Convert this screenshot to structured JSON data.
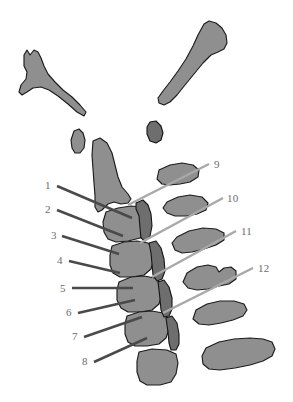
{
  "figure": {
    "type": "anatomical-illustration",
    "background_color": "#ffffff",
    "bone_fill_color": "#8f8f8f",
    "bone_fill_color_dark": "#6e6e6e",
    "bone_outline_color": "#1c1c1c",
    "label_text_color": "#6b6b6b",
    "leader_line_color_dark": "#4a4a4a",
    "leader_line_color_light": "#a8a8a8"
  },
  "labels": {
    "left": [
      {
        "id": "label-1",
        "text": "1",
        "x": 45,
        "y": 180
      },
      {
        "id": "label-2",
        "text": "2",
        "x": 45,
        "y": 204
      },
      {
        "id": "label-3",
        "text": "3",
        "x": 51,
        "y": 230
      },
      {
        "id": "label-4",
        "text": "4",
        "x": 57,
        "y": 255
      },
      {
        "id": "label-5",
        "text": "5",
        "x": 60,
        "y": 283
      },
      {
        "id": "label-6",
        "text": "6",
        "x": 66,
        "y": 307
      },
      {
        "id": "label-7",
        "text": "7",
        "x": 72,
        "y": 331
      },
      {
        "id": "label-8",
        "text": "8",
        "x": 82,
        "y": 356
      }
    ],
    "right": [
      {
        "id": "label-9",
        "text": "9",
        "x": 214,
        "y": 159
      },
      {
        "id": "label-10",
        "text": "10",
        "x": 227,
        "y": 193
      },
      {
        "id": "label-11",
        "text": "11",
        "x": 241,
        "y": 226
      },
      {
        "id": "label-12",
        "text": "12",
        "x": 258,
        "y": 263
      }
    ]
  },
  "leader_lines": {
    "left": [
      {
        "id": "leader-1",
        "x1": 57,
        "y1": 186,
        "x2": 132,
        "y2": 218,
        "tone": "dark"
      },
      {
        "id": "leader-2",
        "x1": 57,
        "y1": 210,
        "x2": 123,
        "y2": 236,
        "tone": "dark"
      },
      {
        "id": "leader-3",
        "x1": 62,
        "y1": 236,
        "x2": 119,
        "y2": 254,
        "tone": "dark"
      },
      {
        "id": "leader-4",
        "x1": 69,
        "y1": 261,
        "x2": 120,
        "y2": 273,
        "tone": "dark"
      },
      {
        "id": "leader-5",
        "x1": 72,
        "y1": 288,
        "x2": 133,
        "y2": 288,
        "tone": "dark"
      },
      {
        "id": "leader-6",
        "x1": 78,
        "y1": 313,
        "x2": 135,
        "y2": 300,
        "tone": "dark"
      },
      {
        "id": "leader-7",
        "x1": 84,
        "y1": 337,
        "x2": 142,
        "y2": 317,
        "tone": "dark"
      },
      {
        "id": "leader-8",
        "x1": 94,
        "y1": 362,
        "x2": 147,
        "y2": 338,
        "tone": "dark"
      }
    ],
    "right": [
      {
        "id": "leader-9",
        "x1": 209,
        "y1": 164,
        "x2": 128,
        "y2": 205,
        "tone": "light"
      },
      {
        "id": "leader-10",
        "x1": 223,
        "y1": 198,
        "x2": 140,
        "y2": 243,
        "tone": "light"
      },
      {
        "id": "leader-11",
        "x1": 236,
        "y1": 231,
        "x2": 152,
        "y2": 277,
        "tone": "light"
      },
      {
        "id": "leader-12",
        "x1": 253,
        "y1": 268,
        "x2": 163,
        "y2": 313,
        "tone": "light"
      }
    ]
  },
  "bone_parts": [
    {
      "id": "bone-upper-left-hook",
      "name": "upper-left-bone-fragment",
      "tone": "light"
    },
    {
      "id": "bone-upper-right-elongated",
      "name": "upper-right-bone-fragment",
      "tone": "light"
    },
    {
      "id": "bone-small-oval-left",
      "name": "small-oval-fragment-left",
      "tone": "light"
    },
    {
      "id": "bone-small-oval-center",
      "name": "small-oval-fragment-center",
      "tone": "dark"
    },
    {
      "id": "bone-spinous-process-top",
      "name": "spinous-process-upper",
      "tone": "light"
    },
    {
      "id": "bone-vertebra-1",
      "name": "vertebral-body-1",
      "tone": "light"
    },
    {
      "id": "bone-vertebra-2",
      "name": "vertebral-body-2",
      "tone": "light"
    },
    {
      "id": "bone-vertebra-3",
      "name": "vertebral-body-3",
      "tone": "light"
    },
    {
      "id": "bone-vertebra-4",
      "name": "vertebral-body-4",
      "tone": "light"
    },
    {
      "id": "bone-vertebra-5",
      "name": "vertebral-body-5",
      "tone": "light"
    },
    {
      "id": "bone-vertebra-6-bottom",
      "name": "vertebral-body-6",
      "tone": "light"
    },
    {
      "id": "bone-rib-right-1",
      "name": "transverse-process-right-1",
      "tone": "light"
    },
    {
      "id": "bone-rib-right-2",
      "name": "transverse-process-right-2",
      "tone": "light"
    },
    {
      "id": "bone-rib-right-3",
      "name": "transverse-process-right-3",
      "tone": "light"
    },
    {
      "id": "bone-rib-right-4",
      "name": "transverse-process-right-4",
      "tone": "light"
    },
    {
      "id": "bone-rib-right-5",
      "name": "transverse-process-right-5",
      "tone": "light"
    },
    {
      "id": "bone-rib-right-6",
      "name": "transverse-process-right-6",
      "tone": "light"
    },
    {
      "id": "bone-posterior-element-1",
      "name": "posterior-element-1",
      "tone": "dark"
    },
    {
      "id": "bone-posterior-element-2",
      "name": "posterior-element-2",
      "tone": "dark"
    },
    {
      "id": "bone-posterior-element-3",
      "name": "posterior-element-3",
      "tone": "dark"
    }
  ]
}
